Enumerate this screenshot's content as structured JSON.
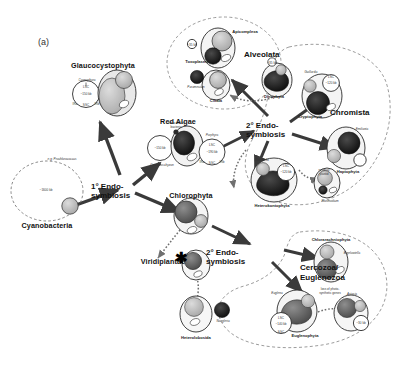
{
  "figure": {
    "panel_label": "(a)",
    "caption_topic": "Endosymbiotic origin of plastids across eukaryotic lineages"
  },
  "events": {
    "primary": "1° Endo-\nsymbiosis",
    "primary_line1": "1° Endo-",
    "primary_line2": "symbiosis",
    "secondary_upper_line1": "2° Endo-",
    "secondary_upper_line2": "symbiosis",
    "secondary_lower_line1": "2° Endo-",
    "secondary_lower_line2": "symbiosis",
    "asterisk": "✱"
  },
  "groups": {
    "glaucocystophyta": "Glaucocystophyta",
    "red_algae": "Red Algae",
    "chlorophyta": "Chlorophyta",
    "viridiplantae": "Viridiplantae",
    "cyanobacteria": "Cyanobacteria",
    "alveolata": "Alveolata",
    "chromista": "Chromista",
    "cercozoa_euglenozoa_line1": "Cercozoa/",
    "cercozoa_euglenozoa_line2": "Euglenozoa"
  },
  "taxa": {
    "apicomplexa": "Apicomplexa",
    "toxoplasma": "Toxoplasma",
    "ciliata": "Ciliata",
    "paramecium": "Paramecium",
    "dinophyta": "Dinophyta",
    "cryptophyta": "Cryptophyta",
    "guillardia": "Guillardia",
    "haptophyta": "Haptophyta",
    "emiliania": "Emiliania",
    "heterokontophyta": "Heterokontophyta",
    "odontella": "Odontella",
    "plasmodium": "Plasmodium",
    "chlorarachniophyta": "Chlorarachniophyta",
    "bigelowiella": "Bigelowiella",
    "euglenophyta": "Euglenophyta",
    "euglena": "Euglena",
    "astasia": "Astasia",
    "heterolobosida": "Heterolobosida",
    "naegleria": "Naegleria",
    "porphyra": "Porphyra",
    "cyanidioschyzon": "Cyanidioschyzon",
    "cyanophora": "Cyanophora"
  },
  "annotations": {
    "prochlorococcus": "e.g. Prochlorococcus",
    "cyano_genome": "~1600 kb",
    "intracellular_bacteria_line1": "intracellular",
    "intracellular_bacteria_line2": "bacteria",
    "loss_genes_line1": "loss of photo-",
    "loss_genes_line2": "synthetic genes",
    "residual_plastid_line1": "residual",
    "residual_plastid_line2": "plastid",
    "genome_150": "~150 kb",
    "genome_120": "~120 kb",
    "genome_190": "~190 kb",
    "genome_140": "~140 kb",
    "genome_35": "~35 kb",
    "genome_30": "~30 kb",
    "gene_lsc": "LSC",
    "gene_ssc": "SSC",
    "gene_ira": "IRa",
    "gene_irb": "IRb"
  },
  "colors": {
    "outline": "#2b2b2b",
    "arrow_solid": "#3a3a3a",
    "arrow_dashed": "#6e6e6e",
    "plastid_dark": "#1a1a1a",
    "plastid_mid": "#5c5c5c",
    "plastid_light": "#b8b8b8",
    "group_boundary": "#7a7a7a",
    "background": "#ffffff"
  }
}
